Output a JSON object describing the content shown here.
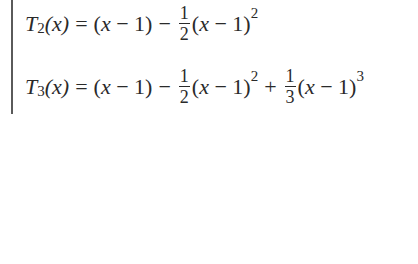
{
  "equations": [
    {
      "lhs_symbol": "T",
      "lhs_subscript": "2",
      "lhs_arg": "(x)",
      "equals": "=",
      "terms": [
        {
          "text": "(x − 1)"
        },
        {
          "op": "−",
          "num": "1",
          "den": "2",
          "text": "(x − 1)",
          "power": "2"
        }
      ]
    },
    {
      "lhs_symbol": "T",
      "lhs_subscript": "3",
      "lhs_arg": "(x)",
      "equals": "=",
      "terms": [
        {
          "text": "(x − 1)"
        },
        {
          "op": "−",
          "num": "1",
          "den": "2",
          "text": "(x − 1)",
          "power": "2"
        },
        {
          "op": "+",
          "num": "1",
          "den": "3",
          "text": "(x − 1)",
          "power": "3"
        }
      ]
    }
  ]
}
